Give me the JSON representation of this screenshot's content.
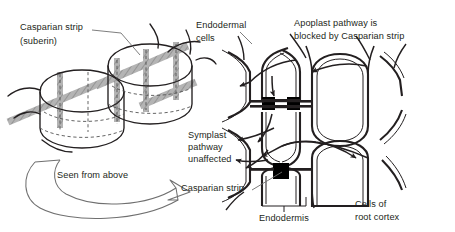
{
  "figure": {
    "colors": {
      "ink": "#231f20",
      "casparian_strip_gray": "#a9a9a9",
      "casparian_block_black": "#000000",
      "leader_line": "#6f6f6f",
      "cell_wall_outline": "#231f20",
      "background": "#ffffff"
    }
  },
  "left_panel": {
    "name": "three-dimensional endodermal cells",
    "labels": {
      "casparian_strip_line1": "Casparian strip",
      "casparian_strip_line2": "(suberin)",
      "seen_from_above": "Seen from above"
    },
    "cell_count": 3,
    "strip_orientation": "encircling band around each cell"
  },
  "right_panel": {
    "name": "cross-section of endodermis and root cortex",
    "labels": {
      "endodermal_cells_line1": "Endodermal",
      "endodermal_cells_line2": "cells",
      "apoplast_line1": "Apoplast pathway is",
      "apoplast_line2": "blocked by Casparian strip",
      "symplast_line1": "Symplast",
      "symplast_line2": "pathway",
      "symplast_line3": "unaffected",
      "casparian_strip": "Casparian strip",
      "endodermis": "Endodermis",
      "cells_of_root_cortex_line1": "Cells of",
      "cells_of_root_cortex_line2": "root cortex"
    },
    "casparian_blocks": 2,
    "arrow_count": 9
  }
}
